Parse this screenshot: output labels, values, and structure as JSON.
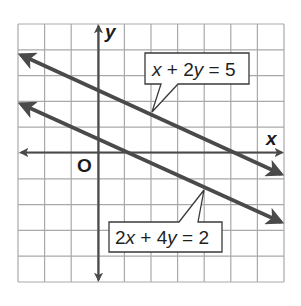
{
  "diagram": {
    "type": "coordinate-plane-graph",
    "axes": {
      "x_label": "x",
      "y_label": "y",
      "origin_label": "O"
    },
    "grid": {
      "columns": 10,
      "rows": 10
    },
    "lines": [
      {
        "equation": "x + 2y = 5",
        "label": "x + 2y = 5",
        "slope": -0.5,
        "y_intercept": 2.5
      },
      {
        "equation": "2x + 4y = 2",
        "label": "2x + 4y = 2",
        "slope": -0.5,
        "y_intercept": 0.5
      }
    ],
    "colors": {
      "line": "#4a4a4a",
      "grid": "#a9a9a9",
      "background": "#ffffff"
    }
  }
}
